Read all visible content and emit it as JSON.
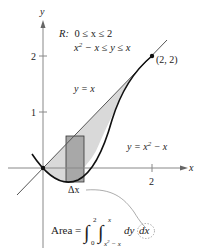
{
  "axes": {
    "x_label": "x",
    "y_label": "y",
    "x_ticks": [
      {
        "value": 2,
        "label": "2"
      }
    ],
    "y_ticks": [
      {
        "value": 1,
        "label": "1"
      },
      {
        "value": 2,
        "label": "2"
      }
    ]
  },
  "region": {
    "label": "R:",
    "line1": "0 ≤ x ≤ 2",
    "line2_lhs": "x",
    "line2_sup": "2",
    "line2_rest": " − x ≤ y ≤ x"
  },
  "curves": {
    "upper": {
      "label_lhs": "y = x",
      "equation": "y = x"
    },
    "lower": {
      "label_lhs": "y = x",
      "label_sup": "2",
      "label_rest": " − x",
      "equation": "y = x^2 - x"
    }
  },
  "point": {
    "label": "(2, 2)",
    "x": 2,
    "y": 2
  },
  "strip": {
    "label": "Δx"
  },
  "area_formula": {
    "prefix": "Area =",
    "outer_upper": "2",
    "outer_lower": "0",
    "inner_upper": "x",
    "inner_lower_base": "x",
    "inner_lower_sup": "2",
    "inner_lower_rest": " − x",
    "integrand": "dy",
    "differential": "dx"
  },
  "colors": {
    "region_fill": "#d9d9d9",
    "strip_fill": "#a8a8a8",
    "axis": "#888888",
    "curve": "#111111",
    "line": "#555555"
  }
}
